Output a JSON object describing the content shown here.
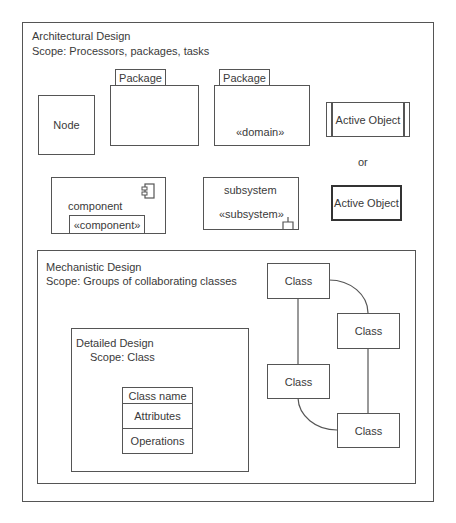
{
  "architectural": {
    "title": "Architectural Design",
    "scope": "Scope: Processors, packages, tasks",
    "node_label": "Node",
    "package1_tab": "Package",
    "package2_tab": "Package",
    "package2_stereotype": "«domain»",
    "active_object1_label": "Active Object",
    "or_label": "or",
    "component_label": "component",
    "component_stereotype": "«component»",
    "subsystem_label": "subsystem",
    "subsystem_stereotype": "«subsystem»",
    "active_object2_label": "Active Object"
  },
  "mechanistic": {
    "title": "Mechanistic Design",
    "scope": "Scope: Groups of collaborating classes",
    "classes": [
      "Class",
      "Class",
      "Class",
      "Class"
    ]
  },
  "detailed": {
    "title": "Detailed Design",
    "scope": "Scope: Class",
    "class_name": "Class name",
    "attributes": "Attributes",
    "operations": "Operations"
  }
}
